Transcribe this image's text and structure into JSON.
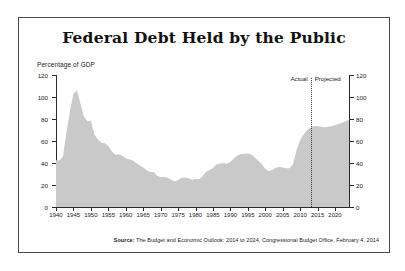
{
  "figure": {
    "title": "Federal Debt Held by the Public",
    "axis_label": "Percentage of GDP",
    "source_prefix": "Source:",
    "source_text": "The Budget and Economic Outlook: 2014 to 2024, Congressional Budget Office, February 4, 2014",
    "annotation_actual": "Actual",
    "annotation_projected": "Projected",
    "colors": {
      "area_fill": "#c9c9c9",
      "axis": "#2b2b2b",
      "frame": "#4a4a4a",
      "background": "#ffffff",
      "text": "#1a1a1a"
    }
  },
  "chart_data": {
    "type": "area",
    "title": "Federal Debt Held by the Public",
    "subtitle": "",
    "xlabel": "",
    "ylabel": "Percentage of GDP",
    "xlim": [
      1940,
      2024
    ],
    "ylim": [
      0,
      120
    ],
    "grid": false,
    "legend_position": "none",
    "y_ticks": [
      0,
      20,
      40,
      60,
      80,
      100,
      120
    ],
    "y_tick_labels": [
      "0",
      "20",
      "40",
      "60",
      "80",
      "100",
      "120"
    ],
    "y_axis_dual": true,
    "x_ticks": [
      1940,
      1945,
      1950,
      1955,
      1960,
      1965,
      1970,
      1975,
      1980,
      1985,
      1990,
      1995,
      2000,
      2005,
      2010,
      2015,
      2020
    ],
    "x_tick_labels": [
      "1940",
      "1945",
      "1950",
      "1955",
      "1960",
      "1965",
      "1970",
      "1975",
      "1980",
      "1985",
      "1990",
      "1995",
      "2000",
      "2005",
      "2010",
      "2015",
      "2020"
    ],
    "annotations": [
      {
        "text": "Actual",
        "x": 2013,
        "align": "right"
      },
      {
        "text": "Projected",
        "x": 2013,
        "align": "left"
      },
      {
        "type": "vline",
        "x": 2013,
        "style": "dotted"
      }
    ],
    "series": [
      {
        "name": "Federal debt held by the public (% of GDP)",
        "x": [
          1940,
          1941,
          1942,
          1943,
          1944,
          1945,
          1946,
          1947,
          1948,
          1949,
          1950,
          1951,
          1952,
          1953,
          1954,
          1955,
          1956,
          1957,
          1958,
          1959,
          1960,
          1961,
          1962,
          1963,
          1964,
          1965,
          1966,
          1967,
          1968,
          1969,
          1970,
          1971,
          1972,
          1973,
          1974,
          1975,
          1976,
          1977,
          1978,
          1979,
          1980,
          1981,
          1982,
          1983,
          1984,
          1985,
          1986,
          1987,
          1988,
          1989,
          1990,
          1991,
          1992,
          1993,
          1994,
          1995,
          1996,
          1997,
          1998,
          1999,
          2000,
          2001,
          2002,
          2003,
          2004,
          2005,
          2006,
          2007,
          2008,
          2009,
          2010,
          2011,
          2012,
          2013,
          2014,
          2015,
          2016,
          2017,
          2018,
          2019,
          2020,
          2021,
          2022,
          2023,
          2024
        ],
        "y": [
          42.5,
          42.3,
          46.0,
          68.0,
          87.0,
          103.0,
          106.1,
          94.0,
          82.5,
          78.0,
          78.5,
          66.0,
          61.5,
          58.5,
          58.0,
          55.5,
          50.5,
          47.5,
          48.0,
          46.5,
          44.3,
          43.5,
          42.3,
          40.0,
          38.0,
          36.0,
          33.5,
          31.8,
          31.8,
          28.3,
          27.0,
          27.4,
          26.5,
          25.0,
          23.2,
          24.5,
          26.7,
          26.9,
          26.1,
          24.8,
          25.5,
          25.2,
          27.8,
          32.0,
          33.7,
          35.4,
          38.7,
          39.6,
          39.9,
          39.4,
          40.9,
          44.1,
          46.8,
          48.1,
          48.4,
          48.7,
          47.7,
          45.0,
          42.0,
          38.8,
          34.7,
          32.5,
          33.6,
          35.6,
          36.3,
          36.0,
          35.3,
          35.2,
          39.3,
          52.3,
          60.9,
          65.8,
          70.1,
          72.3,
          73.6,
          73.4,
          72.9,
          72.6,
          72.9,
          73.5,
          74.5,
          75.4,
          76.7,
          78.0,
          79.2
        ],
        "actual_through": 2013,
        "projected_from": 2014
      }
    ]
  }
}
